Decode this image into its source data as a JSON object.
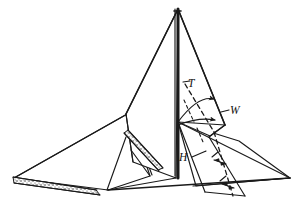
{
  "figure": {
    "style": "hand-drawn line drawing",
    "background_color": "#ffffff",
    "ink_color": "#1a1a1a",
    "width": 297,
    "height": 210
  },
  "labels": {
    "tension": "T",
    "width": "W",
    "height": "H"
  },
  "annotations": {
    "dashed_guide_note": "dashed centerline on right panel",
    "arc_note": "two arcs with arrowheads sweeping from pole",
    "texture_note": "stippled ground strips along lower edges"
  },
  "parts": {
    "apex": "tent-apex",
    "pole": "center-pole",
    "left_wing": "left-ground-flap",
    "right_wing": "right-ground-flap",
    "front_panel": "front-canopy-panel",
    "back_panel": "back-canopy-panel",
    "baseline": "ground-baseline"
  }
}
